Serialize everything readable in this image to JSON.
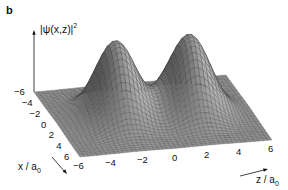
{
  "chart_data": {
    "type": "surface3d",
    "panel_label": "b",
    "title": "",
    "zlabel": "|ψ(x,z)|²",
    "xlabel": "x / a₀",
    "ylabel": "z / a₀",
    "x_ticks": [
      -6,
      -4,
      -2,
      0,
      2,
      4,
      6
    ],
    "z_ticks": [
      -6,
      -4,
      -2,
      0,
      2,
      4,
      6
    ],
    "x_range": [
      -6,
      6
    ],
    "z_range": [
      -6,
      6
    ],
    "peaks": [
      {
        "x": 0,
        "z": -2.3,
        "relative_height": 1.0
      },
      {
        "x": 0,
        "z": 2.3,
        "relative_height": 1.0
      }
    ],
    "grid": false,
    "legend": null
  },
  "labels": {
    "panel": "b",
    "zaxis_main": "|ψ(x,z)|",
    "zaxis_sup": "2",
    "xaxis_main": "x / a",
    "xaxis_sub": "0",
    "zaxis2_main": "z / a",
    "zaxis2_sub": "0"
  },
  "x_tick_labels": [
    "−6",
    "−4",
    "−2",
    "0",
    "2",
    "4",
    "6"
  ],
  "z_tick_labels": [
    "−6",
    "−4",
    "−2",
    "0",
    "2",
    "4",
    "6"
  ]
}
